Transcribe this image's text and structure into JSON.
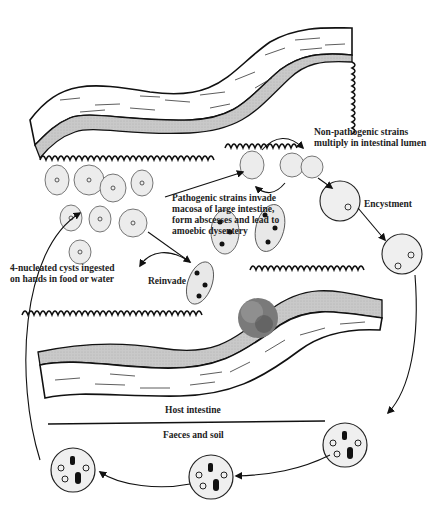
{
  "labels": {
    "non_pathogenic": [
      "Non-pathogenic strains",
      "multiply in intestinal lumen"
    ],
    "pathogenic": [
      "Pathogenic strains invade",
      "macosa of large intestine,",
      "form abscesses and lead to",
      "amoebic dysentery"
    ],
    "encystment": "Encystment",
    "ingested": [
      "4-nucleated cysts ingested",
      "on hands in food or water"
    ],
    "reinvade": "Reinvade",
    "host_intestine": "Host intestine",
    "faeces_soil": "Faeces and soil"
  },
  "colors": {
    "ink": "#1a1a1a",
    "mucosa_band": "#c8c8c8",
    "cell_fill": "#eeeeee",
    "abscess": "#777777"
  }
}
